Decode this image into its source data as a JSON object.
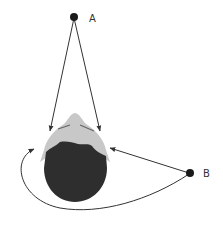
{
  "diagram": {
    "type": "sound-source-localization-top-view",
    "sources": [
      {
        "id": "A",
        "label": "A",
        "x": 74,
        "y": 17
      },
      {
        "id": "B",
        "label": "B",
        "x": 190,
        "y": 173
      }
    ],
    "head": {
      "description": "top view of head facing up",
      "cx": 75,
      "cy": 160
    },
    "paths": [
      {
        "from": "A",
        "to": "left-ear",
        "type": "straight"
      },
      {
        "from": "A",
        "to": "right-ear",
        "type": "straight"
      },
      {
        "from": "B",
        "to": "right-ear",
        "type": "straight"
      },
      {
        "from": "B",
        "to": "left-ear",
        "type": "curved-around-back"
      }
    ],
    "colors": {
      "source_dot": "#1a1a1a",
      "hair": "#2e2e2e",
      "face": "#c8c8c8",
      "arrow": "#333333"
    }
  }
}
